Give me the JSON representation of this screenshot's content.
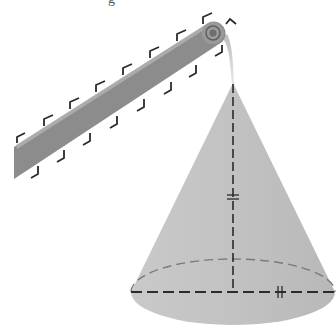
{
  "figure": {
    "top_text_fragment": "g",
    "colors": {
      "background": "#ffffff",
      "belt_fill": "#8c8c8c",
      "belt_cleat": "#2a2a2a",
      "pulley_fill": "#9a9a9a",
      "pulley_ring": "#5e5e5e",
      "stream": "#d0d0d0",
      "cone_fill": "#c4c4c4",
      "cone_base_fill": "#bdbdbd",
      "dash_line": "#2b2b2b",
      "hidden_rim": "#7a7a7a"
    },
    "conveyor": {
      "cleats_top": 8,
      "cleats_bottom": 8,
      "pulley_center": [
        213,
        33
      ],
      "pulley_radius": 11
    },
    "cone": {
      "apex": [
        233,
        83
      ],
      "base_center": [
        233,
        292
      ],
      "base_rx": 102,
      "base_ry": 33,
      "height_tick_mark": "double-tick",
      "radius_tick_mark": "double-tick"
    }
  }
}
